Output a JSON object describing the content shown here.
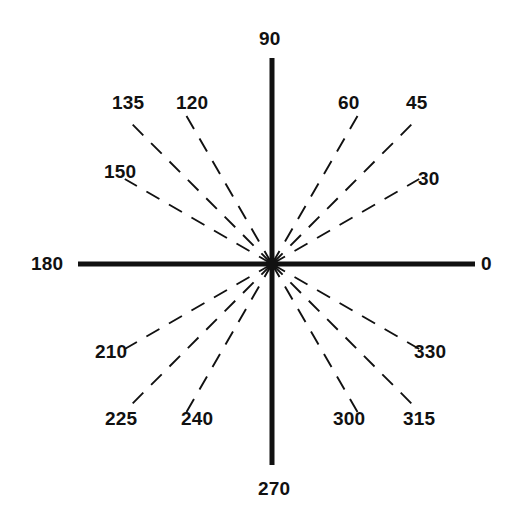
{
  "figure": {
    "background_color": "#ffffff",
    "line_color": "#111111",
    "label_color": "#111111",
    "center": {
      "x": 272,
      "y": 264
    },
    "center_dot_radius": 6
  },
  "axes": [
    {
      "name": "horizontal-axis",
      "label": "180",
      "angle_deg": 180,
      "x1": 78,
      "y1": 264,
      "x2": 475,
      "y2": 264,
      "style": "solid",
      "stroke_width": 5
    },
    {
      "name": "vertical-axis",
      "label": "90",
      "angle_deg": 90,
      "x1": 272,
      "y1": 58,
      "x2": 272,
      "y2": 465,
      "style": "solid",
      "stroke_width": 5
    }
  ],
  "chart_data": {
    "type": "scatter",
    "xlabel": "",
    "ylabel": "",
    "grid": false,
    "legend": "none",
    "units": "degrees",
    "angle_zero_direction": "east",
    "angle_increase_direction": "counter-clockwise",
    "categories": [
      "0",
      "30",
      "45",
      "60",
      "90",
      "120",
      "135",
      "150",
      "180",
      "210",
      "225",
      "240",
      "270",
      "300",
      "315",
      "330"
    ],
    "values": [
      0,
      30,
      45,
      60,
      90,
      120,
      135,
      150,
      180,
      210,
      225,
      240,
      270,
      300,
      315,
      330
    ],
    "axis_rays_deg": [
      0,
      90,
      180,
      270
    ],
    "dashed_rays_deg": [
      30,
      45,
      60,
      120,
      135,
      150,
      210,
      225,
      240,
      300,
      315,
      330
    ],
    "rays": [
      {
        "label": "0",
        "angle_deg": 0,
        "style": "solid",
        "length": 203,
        "label_x": 481,
        "label_y": 254
      },
      {
        "label": "30",
        "angle_deg": 30,
        "style": "dashed",
        "length": 170,
        "label_x": 418,
        "label_y": 169
      },
      {
        "label": "45",
        "angle_deg": 45,
        "style": "dashed",
        "length": 200,
        "label_x": 406,
        "label_y": 93
      },
      {
        "label": "60",
        "angle_deg": 60,
        "style": "dashed",
        "length": 180,
        "label_x": 338,
        "label_y": 93
      },
      {
        "label": "90",
        "angle_deg": 90,
        "style": "solid",
        "length": 206,
        "label_x": 259,
        "label_y": 29
      },
      {
        "label": "120",
        "angle_deg": 120,
        "style": "dashed",
        "length": 180,
        "label_x": 176,
        "label_y": 93
      },
      {
        "label": "135",
        "angle_deg": 135,
        "style": "dashed",
        "length": 200,
        "label_x": 112,
        "label_y": 93
      },
      {
        "label": "150",
        "angle_deg": 150,
        "style": "dashed",
        "length": 170,
        "label_x": 104,
        "label_y": 162
      },
      {
        "label": "180",
        "angle_deg": 180,
        "style": "solid",
        "length": 194,
        "label_x": 31,
        "label_y": 254
      },
      {
        "label": "210",
        "angle_deg": 210,
        "style": "dashed",
        "length": 170,
        "label_x": 95,
        "label_y": 342
      },
      {
        "label": "225",
        "angle_deg": 225,
        "style": "dashed",
        "length": 200,
        "label_x": 105,
        "label_y": 409
      },
      {
        "label": "240",
        "angle_deg": 240,
        "style": "dashed",
        "length": 180,
        "label_x": 181,
        "label_y": 409
      },
      {
        "label": "270",
        "angle_deg": 270,
        "style": "solid",
        "length": 201,
        "label_x": 258,
        "label_y": 479
      },
      {
        "label": "300",
        "angle_deg": 300,
        "style": "dashed",
        "length": 180,
        "label_x": 333,
        "label_y": 409
      },
      {
        "label": "315",
        "angle_deg": 315,
        "style": "dashed",
        "length": 200,
        "label_x": 403,
        "label_y": 409
      },
      {
        "label": "330",
        "angle_deg": 330,
        "style": "dashed",
        "length": 170,
        "label_x": 414,
        "label_y": 342
      }
    ]
  }
}
